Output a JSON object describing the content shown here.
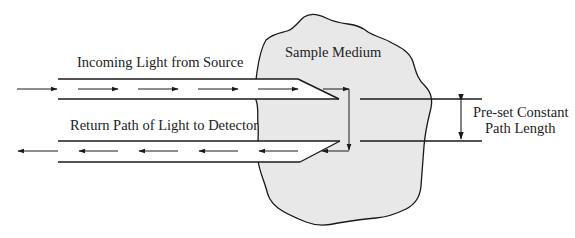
{
  "diagram": {
    "labels": {
      "incoming": "Incoming Light from Source",
      "return": "Return Path of Light to Detector",
      "sample": "Sample Medium",
      "path_length_line1": "Pre-set Constant",
      "path_length_line2": "Path Length"
    },
    "colors": {
      "line": "#1a1a1a",
      "sample_fill": "#e8e8e8",
      "background": "#ffffff",
      "text": "#222222"
    }
  }
}
